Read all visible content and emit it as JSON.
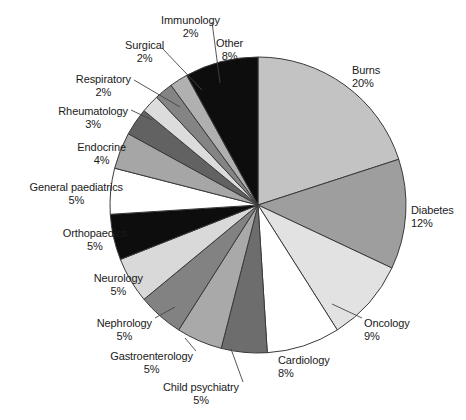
{
  "chart_data": {
    "type": "pie",
    "title": "",
    "subtitle": "",
    "xlabel": "",
    "ylabel": "",
    "legend_position": "none",
    "grid": false,
    "start_angle_deg": 0,
    "direction": "clockwise",
    "units": "percent",
    "total": 100,
    "categories": [
      "Burns",
      "Diabetes",
      "Oncology",
      "Cardiology",
      "Child psychiatry",
      "Gastroenterology",
      "Nephrology",
      "Neurology",
      "Orthopaedics",
      "General paediatrics",
      "Endocrine",
      "Rheumatology",
      "Respiratory",
      "Surgical",
      "Immunology",
      "Other"
    ],
    "values": [
      20,
      12,
      9,
      8,
      5,
      5,
      5,
      5,
      5,
      5,
      4,
      3,
      2,
      2,
      2,
      8
    ],
    "slice_colors": [
      "#c3c3c3",
      "#9e9e9e",
      "#e2e2e2",
      "#ffffff",
      "#6d6d6d",
      "#a9a9a9",
      "#828282",
      "#d9d9d9",
      "#0d0d0d",
      "#ffffff",
      "#a6a6a6",
      "#626262",
      "#dcdcdc",
      "#848484",
      "#b0b0b0",
      "#0d0d0d"
    ],
    "stroke_color": "#3a3a3a",
    "slices": [
      {
        "label": "Burns",
        "percent": 20,
        "percent_text": "20%",
        "color": "#c3c3c3"
      },
      {
        "label": "Diabetes",
        "percent": 12,
        "percent_text": "12%",
        "color": "#9e9e9e"
      },
      {
        "label": "Oncology",
        "percent": 9,
        "percent_text": "9%",
        "color": "#e2e2e2"
      },
      {
        "label": "Cardiology",
        "percent": 8,
        "percent_text": "8%",
        "color": "#ffffff"
      },
      {
        "label": "Child psychiatry",
        "percent": 5,
        "percent_text": "5%",
        "color": "#6d6d6d"
      },
      {
        "label": "Gastroenterology",
        "percent": 5,
        "percent_text": "5%",
        "color": "#a9a9a9"
      },
      {
        "label": "Nephrology",
        "percent": 5,
        "percent_text": "5%",
        "color": "#828282"
      },
      {
        "label": "Neurology",
        "percent": 5,
        "percent_text": "5%",
        "color": "#d9d9d9"
      },
      {
        "label": "Orthopaedics",
        "percent": 5,
        "percent_text": "5%",
        "color": "#0d0d0d"
      },
      {
        "label": "General paediatrics",
        "percent": 5,
        "percent_text": "5%",
        "color": "#ffffff"
      },
      {
        "label": "Endocrine",
        "percent": 4,
        "percent_text": "4%",
        "color": "#a6a6a6"
      },
      {
        "label": "Rheumatology",
        "percent": 3,
        "percent_text": "3%",
        "color": "#626262"
      },
      {
        "label": "Respiratory",
        "percent": 2,
        "percent_text": "2%",
        "color": "#dcdcdc"
      },
      {
        "label": "Surgical",
        "percent": 2,
        "percent_text": "2%",
        "color": "#848484"
      },
      {
        "label": "Immunology",
        "percent": 2,
        "percent_text": "2%",
        "color": "#b0b0b0"
      },
      {
        "label": "Other",
        "percent": 8,
        "percent_text": "8%",
        "color": "#0d0d0d"
      }
    ]
  },
  "geometry": {
    "center_x": 258,
    "center_y": 205,
    "radius": 148
  },
  "labels": [
    {
      "name": "Burns",
      "pct": "20%",
      "x": 352,
      "y": 64,
      "anchor": "left",
      "align": "al-left",
      "leader": null
    },
    {
      "name": "Diabetes",
      "pct": "12%",
      "x": 411,
      "y": 204,
      "anchor": "left",
      "align": "al-left",
      "leader": null
    },
    {
      "name": "Oncology",
      "pct": "9%",
      "x": 364,
      "y": 317,
      "anchor": "left",
      "align": "al-left",
      "leader": {
        "x1": 362,
        "y1": 318,
        "x2": 332,
        "y2": 304
      }
    },
    {
      "name": "Cardiology",
      "pct": "8%",
      "x": 278,
      "y": 354,
      "anchor": "left",
      "align": "al-left",
      "leader": null
    },
    {
      "name": "Child psychiatry",
      "pct": "5%",
      "x": 239,
      "y": 381,
      "anchor": "right",
      "align": "al-center",
      "leader": {
        "x1": 243,
        "y1": 382,
        "x2": 231,
        "y2": 349
      }
    },
    {
      "name": "Gastroenterology",
      "pct": "5%",
      "x": 193,
      "y": 350,
      "anchor": "right",
      "align": "al-center",
      "leader": {
        "x1": 196,
        "y1": 351,
        "x2": 185,
        "y2": 338
      }
    },
    {
      "name": "Nephrology",
      "pct": "5%",
      "x": 152,
      "y": 317,
      "anchor": "right",
      "align": "al-center",
      "leader": {
        "x1": 155,
        "y1": 318,
        "x2": 175,
        "y2": 307
      }
    },
    {
      "name": "Neurology",
      "pct": "5%",
      "x": 143,
      "y": 272,
      "anchor": "right",
      "align": "al-center",
      "leader": null
    },
    {
      "name": "Orthopaedics",
      "pct": "5%",
      "x": 127,
      "y": 227,
      "anchor": "right",
      "align": "al-center",
      "leader": null
    },
    {
      "name": "General paediatrics",
      "pct": "5%",
      "x": 123,
      "y": 181,
      "anchor": "right",
      "align": "al-center",
      "leader": null
    },
    {
      "name": "Endocrine",
      "pct": "4%",
      "x": 126,
      "y": 141,
      "anchor": "right",
      "align": "al-center",
      "leader": null
    },
    {
      "name": "Rheumatology",
      "pct": "3%",
      "x": 128,
      "y": 105,
      "anchor": "right",
      "align": "al-center",
      "leader": {
        "x1": 131,
        "y1": 110,
        "x2": 152,
        "y2": 120
      }
    },
    {
      "name": "Respiratory",
      "pct": "2%",
      "x": 131,
      "y": 73,
      "anchor": "right",
      "align": "al-center",
      "leader": {
        "x1": 134,
        "y1": 80,
        "x2": 180,
        "y2": 107
      }
    },
    {
      "name": "Surgical",
      "pct": "2%",
      "x": 164,
      "y": 39,
      "anchor": "right",
      "align": "al-center",
      "leader": {
        "x1": 162,
        "y1": 48,
        "x2": 202,
        "y2": 90
      }
    },
    {
      "name": "Immunology",
      "pct": "2%",
      "x": 220,
      "y": 14,
      "anchor": "right",
      "align": "al-center",
      "leader": {
        "x1": 212,
        "y1": 22,
        "x2": 220,
        "y2": 83
      }
    },
    {
      "name": "Other",
      "pct": "8%",
      "x": 216,
      "y": 37,
      "anchor": "left",
      "align": "al-center",
      "leader": null
    }
  ]
}
